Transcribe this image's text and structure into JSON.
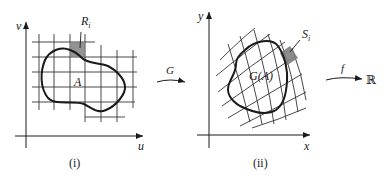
{
  "panels": [
    {
      "id": "i",
      "caption": "(i)",
      "axis_x": "u",
      "axis_y": "v",
      "region_label": "A",
      "cell_label": "R",
      "cell_sub": "i"
    },
    {
      "id": "ii",
      "caption": "(ii)",
      "axis_x": "x",
      "axis_y": "y",
      "region_label": "G(A)",
      "cell_label": "S",
      "cell_sub": "i"
    }
  ],
  "maps": {
    "G": "G",
    "f": "f",
    "codomain": "ℝ"
  },
  "colors": {
    "ink": "#1a1a1a",
    "shaded_cell": "#808080",
    "grid": "#333333"
  }
}
